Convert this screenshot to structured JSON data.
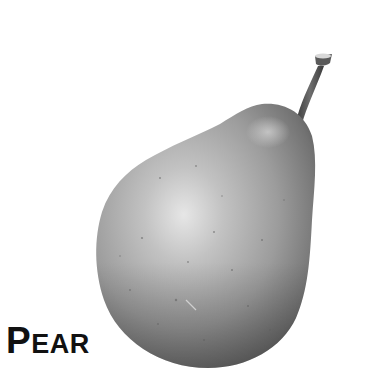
{
  "label": {
    "initial": "P",
    "rest": "EAR",
    "full_text": "PEAR"
  },
  "illustration": {
    "subject": "pear",
    "style": "grayscale photograph",
    "colors": {
      "background": "#ffffff",
      "highlight": "#e4e4e4",
      "mid": "#a6a6a6",
      "shadow": "#5a5a5a",
      "stem": "#4a4a4a",
      "label": "#111111"
    }
  }
}
